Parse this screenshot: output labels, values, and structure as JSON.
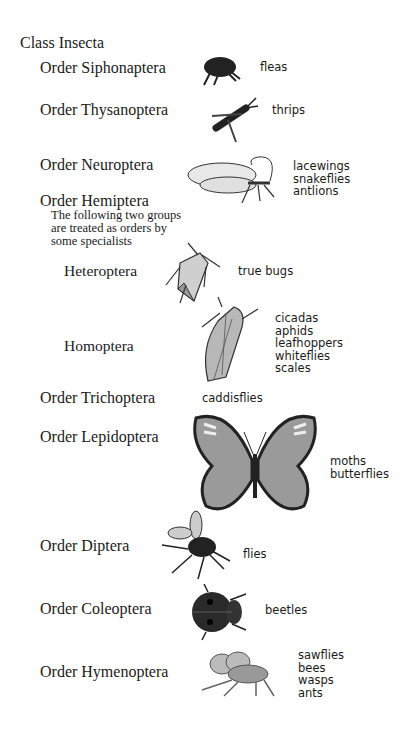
{
  "title": "Class Insecta",
  "orders": [
    {
      "name": "Order Siphonaptera",
      "common": [
        "fleas"
      ],
      "icon": "flea-icon"
    },
    {
      "name": "Order Thysanoptera",
      "common": [
        "thrips"
      ],
      "icon": "thrips-icon"
    },
    {
      "name": "Order Neuroptera",
      "common": [
        "lacewings",
        "snakeflies",
        "antlions"
      ],
      "icon": "lacewing-icon"
    },
    {
      "name": "Order Hemiptera",
      "note": [
        "The following two groups",
        "are treated as orders by",
        "some specialists"
      ],
      "subgroups": [
        {
          "name": "Heteroptera",
          "common": [
            "true bugs"
          ],
          "icon": "true-bug-icon"
        },
        {
          "name": "Homoptera",
          "common": [
            "cicadas",
            "aphids",
            "leafhoppers",
            "whiteflies",
            "scales"
          ],
          "icon": "cicada-icon"
        }
      ]
    },
    {
      "name": "Order Trichoptera",
      "common": [
        "caddisflies"
      ]
    },
    {
      "name": "Order Lepidoptera",
      "common": [
        "moths",
        "butterflies"
      ],
      "icon": "butterfly-icon"
    },
    {
      "name": "Order Diptera",
      "common": [
        "flies"
      ],
      "icon": "fly-icon"
    },
    {
      "name": "Order Coleoptera",
      "common": [
        "beetles"
      ],
      "icon": "beetle-icon"
    },
    {
      "name": "Order Hymenoptera",
      "common": [
        "sawflies",
        "bees",
        "wasps",
        "ants"
      ],
      "icon": "bee-icon"
    }
  ]
}
